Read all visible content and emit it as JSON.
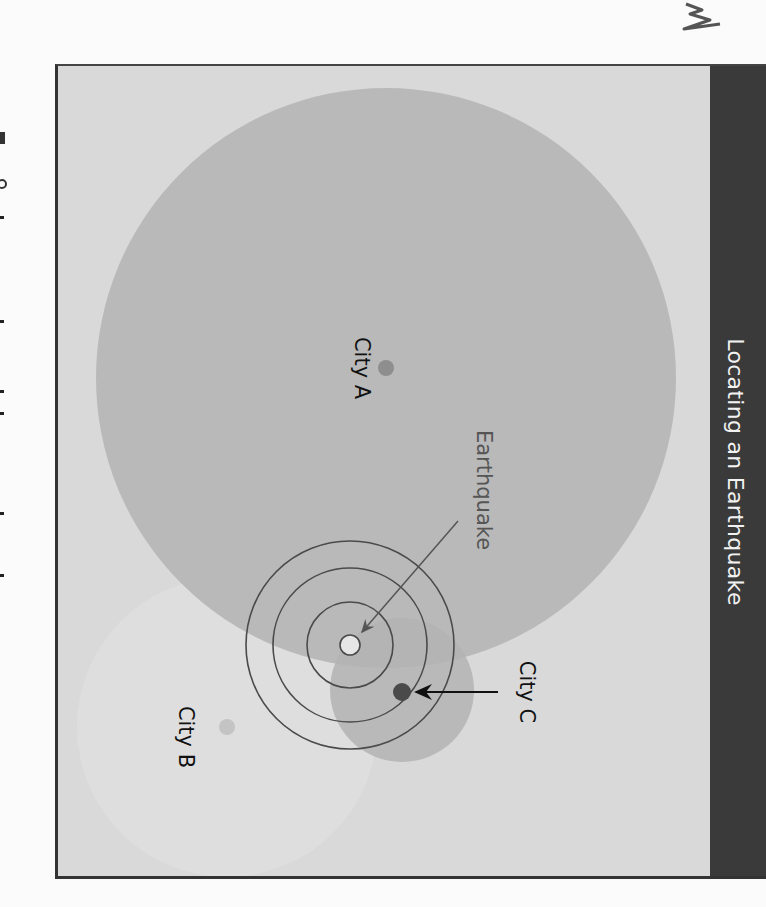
{
  "figure": {
    "title": "Locating an Earthquake",
    "labels": {
      "city_a": "City A",
      "city_b": "City B",
      "city_c": "City C",
      "earthquake": "Earthquake"
    },
    "colors": {
      "background": "#d9d9d9",
      "title_band": "#3a3a3a",
      "title_text": "#f2f2f2",
      "city_a_circle": "#b9b9b9",
      "city_c_circle": "#bdbdbd",
      "city_b_circle": "#e0e0e0",
      "city_a_dot": "#8e8e8e",
      "city_b_dot": "#c4c4c4",
      "city_c_dot": "#4a4a4a",
      "rings": "#4a4a4a"
    }
  }
}
